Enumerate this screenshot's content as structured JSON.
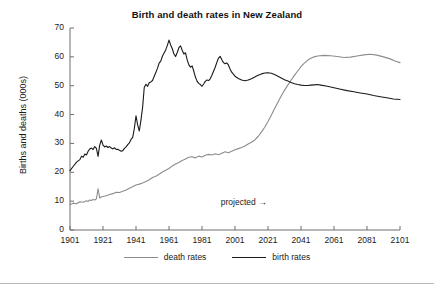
{
  "chart_data": {
    "type": "line",
    "title": "Birth and death rates in New Zealand",
    "xlabel": "",
    "ylabel": "Births and deaths (000s)",
    "xlim": [
      1901,
      2101
    ],
    "ylim": [
      0,
      70
    ],
    "grid": false,
    "legend_position": "bottom",
    "xticks": [
      "1901",
      "1921",
      "1941",
      "1961",
      "1981",
      "2001",
      "2021",
      "2041",
      "2061",
      "2081",
      "2101"
    ],
    "yticks": [
      "0",
      "10",
      "20",
      "30",
      "40",
      "50",
      "60",
      "70"
    ],
    "annotations": [
      {
        "text": "projected",
        "arrow": "→",
        "x": 2013,
        "y": 9.5
      }
    ],
    "series": [
      {
        "name": "death rates",
        "color": "#8c8c8c",
        "points": [
          [
            1901,
            8.8
          ],
          [
            1903,
            9.3
          ],
          [
            1905,
            9.1
          ],
          [
            1907,
            9.8
          ],
          [
            1909,
            9.6
          ],
          [
            1911,
            10.1
          ],
          [
            1912,
            9.9
          ],
          [
            1913,
            10.4
          ],
          [
            1914,
            10.2
          ],
          [
            1915,
            10.6
          ],
          [
            1916,
            10.4
          ],
          [
            1917,
            10.8
          ],
          [
            1918,
            14.3
          ],
          [
            1919,
            11.1
          ],
          [
            1920,
            11.4
          ],
          [
            1921,
            11.6
          ],
          [
            1923,
            11.9
          ],
          [
            1925,
            12.3
          ],
          [
            1927,
            12.6
          ],
          [
            1929,
            13.1
          ],
          [
            1931,
            13.0
          ],
          [
            1933,
            13.4
          ],
          [
            1935,
            13.9
          ],
          [
            1937,
            14.5
          ],
          [
            1939,
            15.0
          ],
          [
            1941,
            15.6
          ],
          [
            1943,
            15.9
          ],
          [
            1945,
            16.3
          ],
          [
            1947,
            16.8
          ],
          [
            1949,
            17.4
          ],
          [
            1951,
            18.2
          ],
          [
            1953,
            18.6
          ],
          [
            1955,
            19.3
          ],
          [
            1957,
            20.1
          ],
          [
            1959,
            20.7
          ],
          [
            1961,
            21.3
          ],
          [
            1963,
            22.2
          ],
          [
            1965,
            22.9
          ],
          [
            1967,
            23.4
          ],
          [
            1969,
            24.1
          ],
          [
            1971,
            24.6
          ],
          [
            1973,
            25.2
          ],
          [
            1975,
            25.4
          ],
          [
            1977,
            25.0
          ],
          [
            1979,
            25.6
          ],
          [
            1981,
            25.3
          ],
          [
            1983,
            25.9
          ],
          [
            1985,
            26.2
          ],
          [
            1987,
            26.0
          ],
          [
            1989,
            26.4
          ],
          [
            1991,
            26.1
          ],
          [
            1993,
            26.6
          ],
          [
            1995,
            27.1
          ],
          [
            1997,
            26.8
          ],
          [
            1999,
            27.3
          ],
          [
            2001,
            27.8
          ],
          [
            2003,
            28.2
          ],
          [
            2005,
            28.6
          ],
          [
            2007,
            29.1
          ],
          [
            2009,
            29.8
          ],
          [
            2011,
            30.4
          ],
          [
            2013,
            31.2
          ],
          [
            2015,
            32.4
          ],
          [
            2017,
            33.9
          ],
          [
            2019,
            35.6
          ],
          [
            2021,
            37.6
          ],
          [
            2023,
            39.8
          ],
          [
            2025,
            42.1
          ],
          [
            2027,
            44.3
          ],
          [
            2029,
            46.4
          ],
          [
            2031,
            48.4
          ],
          [
            2033,
            50.2
          ],
          [
            2035,
            51.9
          ],
          [
            2037,
            53.6
          ],
          [
            2039,
            55.1
          ],
          [
            2041,
            56.6
          ],
          [
            2043,
            57.8
          ],
          [
            2045,
            58.8
          ],
          [
            2047,
            59.5
          ],
          [
            2049,
            60.0
          ],
          [
            2051,
            60.3
          ],
          [
            2055,
            60.5
          ],
          [
            2059,
            60.4
          ],
          [
            2063,
            60.1
          ],
          [
            2067,
            59.8
          ],
          [
            2071,
            59.9
          ],
          [
            2075,
            60.3
          ],
          [
            2079,
            60.7
          ],
          [
            2083,
            60.9
          ],
          [
            2087,
            60.6
          ],
          [
            2091,
            60.0
          ],
          [
            2095,
            59.3
          ],
          [
            2098,
            58.6
          ],
          [
            2101,
            58.0
          ]
        ]
      },
      {
        "name": "birth rates",
        "color": "#1a1a1a",
        "points": [
          [
            1901,
            20.6
          ],
          [
            1903,
            22.1
          ],
          [
            1905,
            23.5
          ],
          [
            1907,
            24.4
          ],
          [
            1908,
            25.6
          ],
          [
            1909,
            25.2
          ],
          [
            1910,
            26.3
          ],
          [
            1911,
            26.0
          ],
          [
            1912,
            27.3
          ],
          [
            1913,
            28.1
          ],
          [
            1914,
            28.4
          ],
          [
            1915,
            27.9
          ],
          [
            1916,
            28.9
          ],
          [
            1917,
            28.3
          ],
          [
            1918,
            25.5
          ],
          [
            1919,
            29.4
          ],
          [
            1920,
            31.2
          ],
          [
            1921,
            29.4
          ],
          [
            1922,
            28.8
          ],
          [
            1923,
            29.1
          ],
          [
            1924,
            28.6
          ],
          [
            1925,
            28.9
          ],
          [
            1926,
            28.4
          ],
          [
            1927,
            28.1
          ],
          [
            1928,
            28.5
          ],
          [
            1929,
            27.9
          ],
          [
            1930,
            28.0
          ],
          [
            1931,
            27.6
          ],
          [
            1932,
            27.3
          ],
          [
            1933,
            27.5
          ],
          [
            1934,
            28.3
          ],
          [
            1935,
            28.8
          ],
          [
            1936,
            29.6
          ],
          [
            1937,
            30.2
          ],
          [
            1938,
            31.4
          ],
          [
            1939,
            32.1
          ],
          [
            1940,
            35.2
          ],
          [
            1941,
            39.6
          ],
          [
            1942,
            36.4
          ],
          [
            1943,
            34.3
          ],
          [
            1944,
            38.1
          ],
          [
            1945,
            42.5
          ],
          [
            1946,
            49.4
          ],
          [
            1947,
            50.5
          ],
          [
            1948,
            49.8
          ],
          [
            1949,
            51.0
          ],
          [
            1950,
            51.3
          ],
          [
            1951,
            51.8
          ],
          [
            1952,
            53.2
          ],
          [
            1953,
            54.6
          ],
          [
            1954,
            56.0
          ],
          [
            1955,
            57.8
          ],
          [
            1956,
            58.5
          ],
          [
            1957,
            60.2
          ],
          [
            1958,
            61.3
          ],
          [
            1959,
            62.4
          ],
          [
            1960,
            64.0
          ],
          [
            1961,
            65.8
          ],
          [
            1962,
            64.1
          ],
          [
            1963,
            62.8
          ],
          [
            1964,
            61.0
          ],
          [
            1965,
            60.1
          ],
          [
            1966,
            61.5
          ],
          [
            1967,
            63.2
          ],
          [
            1968,
            63.8
          ],
          [
            1969,
            62.3
          ],
          [
            1970,
            61.0
          ],
          [
            1971,
            61.4
          ],
          [
            1972,
            59.0
          ],
          [
            1973,
            57.3
          ],
          [
            1974,
            56.4
          ],
          [
            1975,
            56.9
          ],
          [
            1976,
            55.1
          ],
          [
            1977,
            53.0
          ],
          [
            1978,
            51.6
          ],
          [
            1979,
            50.8
          ],
          [
            1980,
            50.4
          ],
          [
            1981,
            49.8
          ],
          [
            1982,
            50.6
          ],
          [
            1983,
            51.5
          ],
          [
            1984,
            52.0
          ],
          [
            1985,
            51.8
          ],
          [
            1986,
            52.4
          ],
          [
            1987,
            53.6
          ],
          [
            1988,
            55.0
          ],
          [
            1989,
            56.4
          ],
          [
            1990,
            58.1
          ],
          [
            1991,
            59.6
          ],
          [
            1992,
            60.2
          ],
          [
            1993,
            59.0
          ],
          [
            1994,
            58.0
          ],
          [
            1995,
            57.6
          ],
          [
            1996,
            57.9
          ],
          [
            1997,
            57.2
          ],
          [
            1998,
            55.8
          ],
          [
            1999,
            54.7
          ],
          [
            2000,
            54.0
          ],
          [
            2001,
            53.3
          ],
          [
            2003,
            52.5
          ],
          [
            2005,
            52.0
          ],
          [
            2007,
            51.7
          ],
          [
            2009,
            52.0
          ],
          [
            2011,
            52.4
          ],
          [
            2013,
            53.0
          ],
          [
            2015,
            53.6
          ],
          [
            2017,
            54.1
          ],
          [
            2019,
            54.4
          ],
          [
            2021,
            54.5
          ],
          [
            2023,
            54.3
          ],
          [
            2025,
            53.9
          ],
          [
            2027,
            53.3
          ],
          [
            2029,
            52.7
          ],
          [
            2031,
            52.1
          ],
          [
            2033,
            51.6
          ],
          [
            2035,
            51.1
          ],
          [
            2037,
            50.7
          ],
          [
            2039,
            50.4
          ],
          [
            2041,
            50.2
          ],
          [
            2043,
            50.1
          ],
          [
            2045,
            50.1
          ],
          [
            2047,
            50.2
          ],
          [
            2049,
            50.3
          ],
          [
            2051,
            50.4
          ],
          [
            2053,
            50.2
          ],
          [
            2057,
            49.8
          ],
          [
            2061,
            49.3
          ],
          [
            2065,
            48.8
          ],
          [
            2069,
            48.3
          ],
          [
            2073,
            47.9
          ],
          [
            2077,
            47.5
          ],
          [
            2081,
            47.1
          ],
          [
            2085,
            46.6
          ],
          [
            2089,
            46.2
          ],
          [
            2093,
            45.8
          ],
          [
            2097,
            45.4
          ],
          [
            2101,
            45.2
          ]
        ]
      }
    ]
  },
  "legend": {
    "entries": [
      {
        "label": "death rates",
        "color": "#8c8c8c"
      },
      {
        "label": "birth rates",
        "color": "#1a1a1a"
      }
    ]
  }
}
